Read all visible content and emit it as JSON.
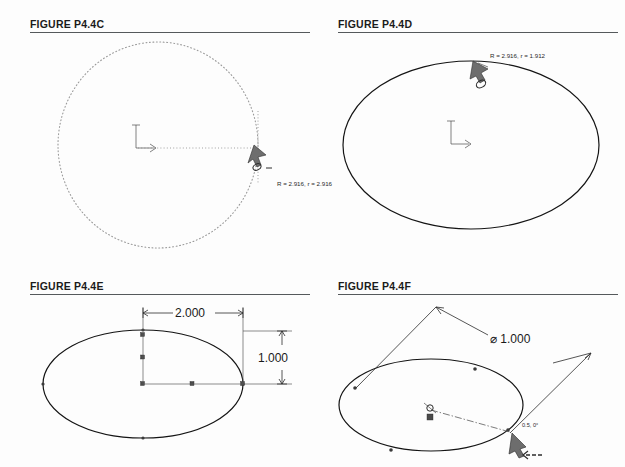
{
  "page": {
    "background_color": "#fdfdfd",
    "line_color": "#141414",
    "rule_color": "#55595c"
  },
  "figures": [
    {
      "id": "p44c",
      "title": "FIGURE P4.4C",
      "shape": "circle-dotted",
      "annotation": "R = 2.916, r = 2.916",
      "center_mark": "L-axis-marker",
      "radius_line": "dotted",
      "cursor": "rotate-handle-icon"
    },
    {
      "id": "p44d",
      "title": "FIGURE P4.4D",
      "shape": "ellipse-solid",
      "annotation": "R = 2.916, r = 1.912",
      "center_mark": "L-axis-marker",
      "cursor": "rotate-handle-icon"
    },
    {
      "id": "p44e",
      "title": "FIGURE P4.4E",
      "shape": "ellipse-solid",
      "dimensions": [
        {
          "name": "major-width",
          "value": "2.000",
          "orientation": "horizontal"
        },
        {
          "name": "minor-height",
          "value": "1.000",
          "orientation": "vertical"
        }
      ]
    },
    {
      "id": "p44f",
      "title": "FIGURE P4.4F",
      "shape": "ellipse-solid",
      "dimensions": [
        {
          "name": "diameter",
          "value": "⌀ 1.000",
          "orientation": "angled"
        }
      ],
      "annotation": "0.5, 0°",
      "center_mark": "point-marker",
      "cursor": "move-arrow-icon"
    }
  ]
}
